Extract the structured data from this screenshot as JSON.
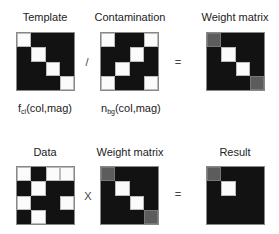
{
  "top_row": {
    "template": {
      "title": "Template",
      "label_main": "f",
      "label_sub": "cl",
      "label_args": "(col,mag)",
      "cells": [
        "w",
        "b",
        "b",
        "b",
        "b",
        "w",
        "b",
        "b",
        "b",
        "b",
        "w",
        "b",
        "b",
        "b",
        "b",
        "w"
      ]
    },
    "operator1": "/",
    "contamination": {
      "title": "Contamination",
      "label_main": "n",
      "label_sub": "bg",
      "label_args": "(col,mag)",
      "cells": [
        "w",
        "b",
        "b",
        "w",
        "b",
        "b",
        "w",
        "b",
        "b",
        "w",
        "b",
        "b",
        "w",
        "b",
        "b",
        "w"
      ]
    },
    "operator2": "=",
    "weight_matrix": {
      "title": "Weight matrix",
      "cells": [
        "g",
        "b",
        "b",
        "b",
        "b",
        "w",
        "b",
        "b",
        "b",
        "b",
        "w",
        "b",
        "b",
        "b",
        "b",
        "g"
      ]
    }
  },
  "bottom_row": {
    "data": {
      "title": "Data",
      "cells": [
        "w",
        "b",
        "w",
        "w",
        "b",
        "w",
        "b",
        "b",
        "w",
        "b",
        "b",
        "w",
        "b",
        "w",
        "b",
        "b"
      ]
    },
    "operator1": "X",
    "weight_matrix": {
      "title": "Weight matrix",
      "cells": [
        "g",
        "b",
        "b",
        "b",
        "b",
        "w",
        "b",
        "b",
        "b",
        "b",
        "w",
        "b",
        "b",
        "b",
        "b",
        "g"
      ]
    },
    "operator2": "=",
    "result": {
      "title": "Result",
      "cells": [
        "g",
        "b",
        "b",
        "b",
        "b",
        "w",
        "b",
        "b",
        "b",
        "b",
        "b",
        "b",
        "b",
        "b",
        "b",
        "b"
      ]
    }
  },
  "colors": {
    "black": "#121212",
    "white": "#fbfbfb",
    "gray": "#5c5c5c"
  }
}
